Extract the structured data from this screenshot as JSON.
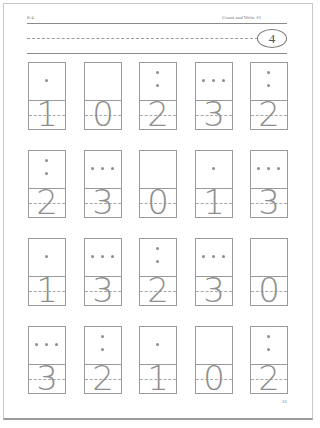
{
  "header": {
    "left_label": "8-4",
    "title": "Count and Write #1",
    "oval_number": "4"
  },
  "footer": {
    "page_number": "31"
  },
  "colors": {
    "line": "#9a9a9a",
    "dot": "#8e8e8e",
    "digit": "#8e8e8e"
  },
  "grid": {
    "columns_x": [
      28,
      84,
      139,
      195,
      250
    ],
    "rows_y": [
      62,
      150,
      238,
      326
    ],
    "rows": [
      {
        "cards": [
          {
            "dots": 1,
            "digit": "1"
          },
          {
            "dots": 0,
            "digit": "0"
          },
          {
            "dots": 2,
            "digit": "2"
          },
          {
            "dots": 3,
            "digit": "3"
          },
          {
            "dots": 2,
            "digit": "2"
          }
        ]
      },
      {
        "cards": [
          {
            "dots": 2,
            "digit": "2"
          },
          {
            "dots": 3,
            "digit": "3"
          },
          {
            "dots": 0,
            "digit": "0"
          },
          {
            "dots": 1,
            "digit": "1"
          },
          {
            "dots": 3,
            "digit": "3"
          }
        ]
      },
      {
        "cards": [
          {
            "dots": 1,
            "digit": "1"
          },
          {
            "dots": 3,
            "digit": "3"
          },
          {
            "dots": 2,
            "digit": "2"
          },
          {
            "dots": 3,
            "digit": "3"
          },
          {
            "dots": 0,
            "digit": "0"
          }
        ]
      },
      {
        "cards": [
          {
            "dots": 3,
            "digit": "3"
          },
          {
            "dots": 2,
            "digit": "2"
          },
          {
            "dots": 1,
            "digit": "1"
          },
          {
            "dots": 0,
            "digit": "0"
          },
          {
            "dots": 2,
            "digit": "2"
          }
        ]
      }
    ]
  }
}
